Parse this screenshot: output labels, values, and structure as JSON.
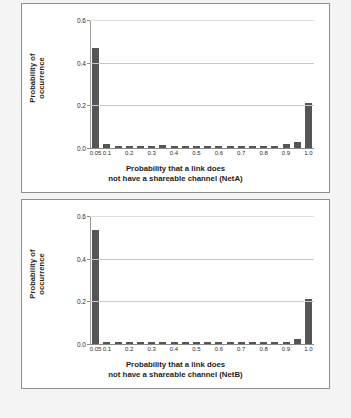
{
  "chart_data": [
    {
      "type": "bar",
      "title": "",
      "xlabel": "Probability that a link does not have a shareable channel (NetA)",
      "xlabel_line1": "Probability that a link does",
      "xlabel_line2": "not have a shareable channel (NetA)",
      "ylabel": "Probability of occurrence",
      "ylabel_line1": "Probability of",
      "ylabel_line2": "occurrence",
      "ylim": [
        0.0,
        0.6
      ],
      "xlim": [
        0.025,
        1.025
      ],
      "grid": true,
      "legend": "none",
      "ytick_labels": [
        "0.0",
        "0.2",
        "0.4",
        "0.6"
      ],
      "ytick_values": [
        0.0,
        0.2,
        0.4,
        0.6
      ],
      "xtick_labels": [
        "0.05",
        "0.1",
        "0.2",
        "0.3",
        "0.4",
        "0.5",
        "0.6",
        "0.7",
        "0.8",
        "0.9",
        "1.0"
      ],
      "xtick_values": [
        0.05,
        0.1,
        0.2,
        0.3,
        0.4,
        0.5,
        0.6,
        0.7,
        0.8,
        0.9,
        1.0
      ],
      "bar_color": "#555555",
      "categories": [
        0.05,
        0.1,
        0.15,
        0.2,
        0.25,
        0.3,
        0.35,
        0.4,
        0.45,
        0.5,
        0.55,
        0.6,
        0.65,
        0.7,
        0.75,
        0.8,
        0.85,
        0.9,
        0.95,
        1.0
      ],
      "values": [
        0.47,
        0.018,
        0.009,
        0.011,
        0.01,
        0.011,
        0.012,
        0.005,
        0.005,
        0.005,
        0.005,
        0.011,
        0.01,
        0.01,
        0.01,
        0.01,
        0.011,
        0.018,
        0.028,
        0.21
      ]
    },
    {
      "type": "bar",
      "title": "",
      "xlabel": "Probability that a link does not have a shareable channel (NetB)",
      "xlabel_line1": "Probability that a link does",
      "xlabel_line2": "not have a shareable channel (NetB)",
      "ylabel": "Probability of occurrence",
      "ylabel_line1": "Probability of",
      "ylabel_line2": "occurrence",
      "ylim": [
        0.0,
        0.6
      ],
      "xlim": [
        0.025,
        1.025
      ],
      "grid": true,
      "legend": "none",
      "ytick_labels": [
        "0.0",
        "0.2",
        "0.4",
        "0.6"
      ],
      "ytick_values": [
        0.0,
        0.2,
        0.4,
        0.6
      ],
      "xtick_labels": [
        "0.05",
        "0.1",
        "0.2",
        "0.3",
        "0.4",
        "0.5",
        "0.6",
        "0.7",
        "0.8",
        "0.9",
        "1.0"
      ],
      "xtick_values": [
        0.05,
        0.1,
        0.2,
        0.3,
        0.4,
        0.5,
        0.6,
        0.7,
        0.8,
        0.9,
        1.0
      ],
      "bar_color": "#555555",
      "categories": [
        0.05,
        0.1,
        0.15,
        0.2,
        0.25,
        0.3,
        0.35,
        0.4,
        0.45,
        0.5,
        0.55,
        0.6,
        0.65,
        0.7,
        0.75,
        0.8,
        0.85,
        0.9,
        0.95,
        1.0
      ],
      "values": [
        0.535,
        0.01,
        0.01,
        0.01,
        0.01,
        0.01,
        0.01,
        0.01,
        0.01,
        0.01,
        0.01,
        0.01,
        0.01,
        0.01,
        0.01,
        0.01,
        0.01,
        0.01,
        0.022,
        0.21
      ]
    }
  ]
}
